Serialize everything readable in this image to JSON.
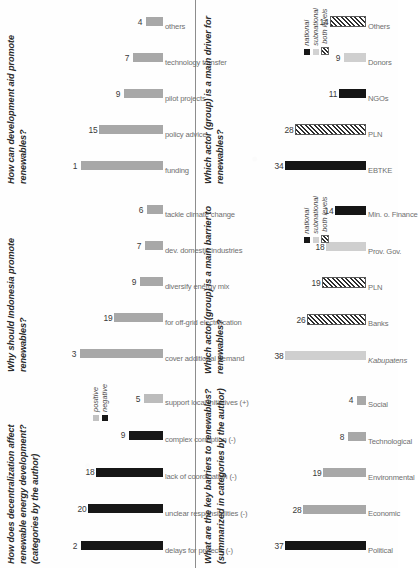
{
  "page": {
    "orientation": "rotated-90-ccw",
    "divider": true,
    "colors": {
      "negative": "#171717",
      "positive": "#bcbcbc",
      "national": "#171717",
      "subnational": "#d2d2d2",
      "both_levels": "#2e2e2e",
      "bar_gray": "#a8a8a8",
      "text": "#2a2a2a",
      "label_gray": "#6f6f6f"
    }
  },
  "charts": [
    {
      "id": "decentralization-effect",
      "type": "bar",
      "title": "How does decentralization affect renewable energy development?",
      "subtitle": "(categories by the author)",
      "categories": [
        "delays for projects (-)",
        "unclear responsibilities (-)",
        "lack of coordination (-)",
        "complex corruption (-)",
        "support local initiatives (+)"
      ],
      "values": [
        22,
        20,
        18,
        9,
        5
      ],
      "value_labels": [
        "2",
        "20",
        "18",
        "9",
        "5"
      ],
      "styles": [
        "neg",
        "neg",
        "neg",
        "neg",
        "pos"
      ],
      "ylim": [
        0,
        23
      ],
      "legend": {
        "position": "top-right",
        "entries": [
          {
            "label": "positive",
            "swatch": "gray"
          },
          {
            "label": "negative",
            "swatch": "black"
          }
        ]
      },
      "xlabel": "",
      "ylabel": ""
    },
    {
      "id": "why-promote-renewables",
      "type": "bar",
      "title": "Why should Indonesia promote renewables?",
      "subtitle": "",
      "categories": [
        "cover additional demand",
        "for off-grid electrification",
        "diversify energy mix",
        "dev. domestic industries",
        "tackle climate change"
      ],
      "values": [
        32,
        19,
        9,
        7,
        6
      ],
      "value_labels": [
        "3",
        "19",
        "9",
        "7",
        "6"
      ],
      "styles": [
        "gray",
        "gray",
        "gray",
        "gray",
        "gray"
      ],
      "ylim": [
        0,
        33
      ],
      "legend": null,
      "xlabel": "",
      "ylabel": ""
    },
    {
      "id": "development-aid",
      "type": "bar",
      "title": "How can development aid promote renewables?",
      "subtitle": "",
      "categories": [
        "funding",
        "policy advice",
        "pilot projects",
        "technology transfer",
        "others"
      ],
      "values": [
        19,
        15,
        9,
        7,
        4
      ],
      "value_labels": [
        "1",
        "15",
        "9",
        "7",
        "4"
      ],
      "styles": [
        "gray",
        "gray",
        "gray",
        "gray",
        "gray"
      ],
      "ylim": [
        0,
        20
      ],
      "legend": null,
      "xlabel": "",
      "ylabel": ""
    },
    {
      "id": "key-barriers",
      "type": "bar",
      "title": "What are the key barriers to renewables?",
      "subtitle": "(summarized in categories by the author)",
      "categories": [
        "Political",
        "Economic",
        "Environmental",
        "Technological",
        "Social"
      ],
      "values": [
        37,
        28,
        19,
        8,
        4
      ],
      "value_labels": [
        "37",
        "28",
        "19",
        "8",
        "4"
      ],
      "styles": [
        "dark",
        "gray",
        "gray",
        "gray",
        "gray"
      ],
      "ylim": [
        0,
        38
      ],
      "legend": null,
      "xlabel": "",
      "ylabel": ""
    },
    {
      "id": "main-barrier-actor",
      "type": "bar",
      "title": "Which actor (group) is a main barrier to renewables?",
      "subtitle": "",
      "categories": [
        "Kabupatens",
        "Banks",
        "PLN",
        "Prov. Gov.",
        "Min. o. Finance"
      ],
      "values": [
        38,
        26,
        19,
        18,
        14
      ],
      "value_labels": [
        "38",
        "26",
        "19",
        "18",
        "14"
      ],
      "styles": [
        "ltgray",
        "hatch",
        "hatch",
        "ltgray",
        "dark"
      ],
      "ylim": [
        0,
        39
      ],
      "legend": {
        "position": "top-right",
        "entries": [
          {
            "label": "national",
            "swatch": "black"
          },
          {
            "label": "subnational",
            "swatch": "ltgray"
          },
          {
            "label": "both levels",
            "swatch": "hatch"
          }
        ]
      },
      "xlabel": "",
      "ylabel": ""
    },
    {
      "id": "main-driver-actor",
      "type": "bar",
      "title": "Which actor (group) is a main driver for renewables?",
      "subtitle": "",
      "categories": [
        "EBTKE",
        "PLN",
        "NGOs",
        "Donors",
        "Others"
      ],
      "values": [
        34,
        28,
        11,
        9,
        14
      ],
      "value_labels": [
        "34",
        "28",
        "11",
        "9",
        "14"
      ],
      "styles": [
        "dark",
        "hatch",
        "dark",
        "ltgray",
        "hatch"
      ],
      "ylim": [
        0,
        35
      ],
      "legend": {
        "position": "top-right",
        "entries": [
          {
            "label": "national",
            "swatch": "black"
          },
          {
            "label": "subnational",
            "swatch": "ltgray"
          },
          {
            "label": "both levels",
            "swatch": "hatch"
          }
        ]
      },
      "xlabel": "",
      "ylabel": ""
    }
  ]
}
